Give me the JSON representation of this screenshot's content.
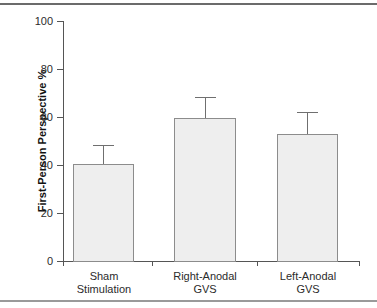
{
  "chart_data": {
    "type": "bar",
    "title": "",
    "xlabel": "",
    "ylabel": "First-Person Perspective %",
    "categories": [
      "Sham Stimulation",
      "Right-Anodal GVS",
      "Left-Anodal GVS"
    ],
    "category_lines": [
      [
        "Sham",
        "Stimulation"
      ],
      [
        "Right-Anodal",
        "GVS"
      ],
      [
        "Left-Anodal",
        "GVS"
      ]
    ],
    "values": [
      40.5,
      59.5,
      53.0
    ],
    "errors": [
      8.0,
      8.7,
      9.0
    ],
    "error_upper": [
      48.5,
      68.2,
      62.0
    ],
    "ylim": [
      0,
      100
    ],
    "yticks": [
      0,
      20,
      40,
      60,
      80,
      100
    ],
    "ytick_labels": [
      "0",
      "20",
      "40",
      "60",
      "80",
      "100"
    ],
    "grid": false,
    "legend": null,
    "bar_fill_color": "#eeeeee",
    "bar_edge_color": "#8c8c8c",
    "error_bar_color": "#6f6f6f",
    "axis_color": "#555555"
  }
}
